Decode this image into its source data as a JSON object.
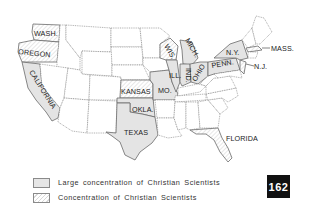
{
  "map": {
    "title": "Concentrations of Christian Scientists in the United States",
    "state_labels": {
      "wash": "WASH.",
      "oregon": "OREGON",
      "california": "CALIFORNIA",
      "kansas": "KANSAS",
      "mo": "MO.",
      "okla": "OKLA.",
      "texas": "TEXAS",
      "ill": "ILL.",
      "ind": "IND.",
      "ohio": "OHIO",
      "wis": "WIS.",
      "mich": "MICH.",
      "ny": "N.Y.",
      "penn": "PENN.",
      "nj": "N.J.",
      "mass": "MASS.",
      "florida": "FLORIDA"
    },
    "large_concentration_states": [
      "WASH.",
      "OREGON",
      "CALIFORNIA",
      "TEXAS",
      "OKLA.",
      "ILL.",
      "IND.",
      "OHIO",
      "MICH.",
      "N.Y.",
      "PENN.",
      "MO."
    ],
    "concentration_states": [
      "WASH.",
      "OREGON",
      "CALIFORNIA",
      "WIS.",
      "N.J.",
      "MASS.",
      "FLORIDA",
      "KANSAS"
    ],
    "colors": {
      "large_fill": "#e4e4e4",
      "border": "#7a7a7a",
      "background": "#ffffff"
    }
  },
  "legend": {
    "items": [
      {
        "label": "Large concentration of Christian Scientists",
        "style": "solid-gray"
      },
      {
        "label": "Concentration of Christian Scientists",
        "style": "hatched"
      }
    ]
  },
  "page_number": "162"
}
